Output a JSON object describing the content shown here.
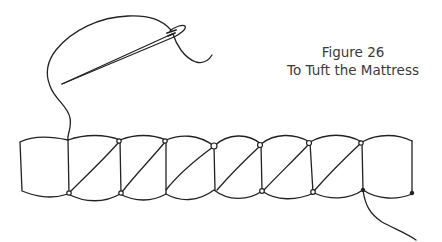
{
  "figure": {
    "number_label": "Figure 26",
    "title": "To Tuft the Mattress"
  },
  "illustration": {
    "subject": "mattress-edge-tufting",
    "segment_count": 8,
    "diagonal_stitch_count": 6,
    "elements": [
      "needle-icon",
      "thread",
      "mattress-roll",
      "tuft-knots",
      "exit-thread"
    ],
    "ink_color": "#222222",
    "background_color": "#ffffff"
  }
}
